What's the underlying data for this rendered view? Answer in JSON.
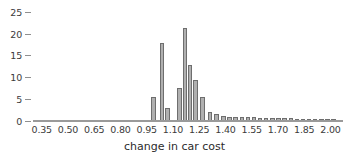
{
  "chart_data": {
    "type": "bar",
    "title": "",
    "xlabel": "change in car cost",
    "ylabel": "",
    "grid": false,
    "legend": null,
    "bin_width": 0.025,
    "xlim": [
      0.3,
      2.06
    ],
    "ylim": [
      0,
      26
    ],
    "x_ticks": [
      "0.35",
      "0.50",
      "0.65",
      "0.80",
      "0.95",
      "1.10",
      "1.25",
      "1.40",
      "1.55",
      "1.70",
      "1.85",
      "2.00"
    ],
    "x_tick_values": [
      0.35,
      0.5,
      0.65,
      0.8,
      0.95,
      1.1,
      1.25,
      1.4,
      1.55,
      1.7,
      1.85,
      2.0
    ],
    "y_ticks": [
      "0",
      "5",
      "10",
      "15",
      "20",
      "25"
    ],
    "y_tick_values": [
      0,
      5,
      10,
      15,
      20,
      25
    ],
    "bin_starts": [
      0.975,
      1.0,
      1.025,
      1.05,
      1.075,
      1.1,
      1.125,
      1.15,
      1.175,
      1.2,
      1.225,
      1.25,
      1.275,
      1.3,
      1.325,
      1.35,
      1.375,
      1.4,
      1.425,
      1.45,
      1.475,
      1.5,
      1.525,
      1.55,
      1.575,
      1.6,
      1.625,
      1.65,
      1.675,
      1.7,
      1.725,
      1.75,
      1.775,
      1.8,
      1.825,
      1.85,
      1.875,
      1.9,
      1.925,
      1.95,
      1.975,
      2.0
    ],
    "categories": [
      "0.975",
      "1.000",
      "1.025",
      "1.050",
      "1.075",
      "1.100",
      "1.125",
      "1.150",
      "1.175",
      "1.200",
      "1.225",
      "1.250",
      "1.275",
      "1.300",
      "1.325",
      "1.350",
      "1.375",
      "1.400",
      "1.425",
      "1.450",
      "1.475",
      "1.500",
      "1.525",
      "1.550",
      "1.575",
      "1.600",
      "1.625",
      "1.650",
      "1.675",
      "1.700",
      "1.725",
      "1.750",
      "1.775",
      "1.800",
      "1.825",
      "1.850",
      "1.875",
      "1.900",
      "1.925",
      "1.950",
      "1.975",
      "2.000"
    ],
    "values": [
      5.5,
      0,
      18,
      3,
      0,
      0,
      7.5,
      0,
      21.5,
      13,
      9.5,
      0,
      5.5,
      0,
      2,
      1.7,
      0,
      1.1,
      1,
      0.9,
      0.9,
      0.9,
      0.9,
      0.8,
      0.8,
      0.7,
      0.7,
      0.6,
      0.6,
      0.5,
      0.5,
      0.4,
      0.4,
      0.3,
      0.3,
      0.3,
      0.2,
      0.2,
      0.2,
      0.2,
      0.1,
      0.1
    ],
    "bars": [
      {
        "x": 0.975,
        "height": 5.5
      },
      {
        "x": 1.025,
        "height": 18
      },
      {
        "x": 1.055,
        "height": 3
      },
      {
        "x": 1.125,
        "height": 7.5
      },
      {
        "x": 1.155,
        "height": 21.5
      },
      {
        "x": 1.185,
        "height": 13
      },
      {
        "x": 1.215,
        "height": 9.5
      },
      {
        "x": 1.255,
        "height": 5.5
      },
      {
        "x": 1.3,
        "height": 2
      },
      {
        "x": 1.335,
        "height": 1.7
      },
      {
        "x": 1.375,
        "height": 1.1
      },
      {
        "x": 1.41,
        "height": 1.0
      },
      {
        "x": 1.445,
        "height": 0.9
      },
      {
        "x": 1.48,
        "height": 0.9
      },
      {
        "x": 1.515,
        "height": 0.9
      },
      {
        "x": 1.55,
        "height": 0.9
      },
      {
        "x": 1.585,
        "height": 0.8
      },
      {
        "x": 1.62,
        "height": 0.8
      },
      {
        "x": 1.655,
        "height": 0.7
      },
      {
        "x": 1.69,
        "height": 0.7
      },
      {
        "x": 1.725,
        "height": 0.6
      },
      {
        "x": 1.76,
        "height": 0.6
      },
      {
        "x": 1.795,
        "height": 0.5
      },
      {
        "x": 1.83,
        "height": 0.5
      },
      {
        "x": 1.865,
        "height": 0.4
      },
      {
        "x": 1.9,
        "height": 0.4
      },
      {
        "x": 1.935,
        "height": 0.3
      },
      {
        "x": 1.97,
        "height": 0.3
      },
      {
        "x": 2.005,
        "height": 0.2
      }
    ],
    "colors": {
      "bar_fill": "#b0b0b0",
      "bar_stroke": "#6e6e6e",
      "axis": "#9a9a9a",
      "text": "#3b3b3b",
      "background": "#ffffff"
    }
  }
}
